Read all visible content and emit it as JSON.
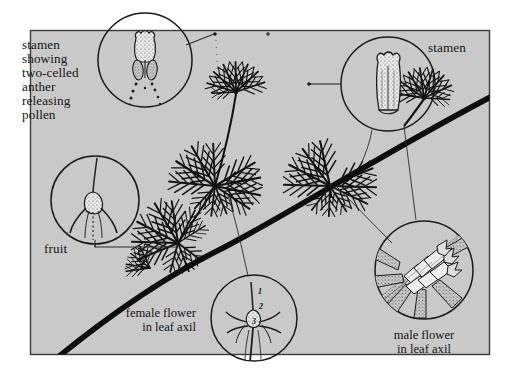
{
  "figure": {
    "panel": {
      "background_color": "#c9c9c9",
      "border_color": "#3b3b3b",
      "x": 30,
      "y": 30,
      "width": 460,
      "height": 325
    },
    "outer_background_color": "#ffffff",
    "ink_color": "#111111"
  },
  "labels": {
    "stamen_detail": {
      "lines": [
        "stamen",
        "showing",
        "two-celled",
        "anther",
        "releasing",
        "pollen"
      ],
      "align": "left",
      "x": 22,
      "y": 49
    },
    "stamen": {
      "text": "stamen",
      "align": "left",
      "x": 428,
      "y": 52
    },
    "fruit": {
      "text": "fruit",
      "align": "left",
      "x": 44,
      "y": 253
    },
    "female_flower": {
      "lines": [
        "female flower",
        "in leaf axil"
      ],
      "align": "right",
      "x": 196,
      "y": 317
    },
    "male_flower": {
      "lines": [
        "male flower",
        "in leaf axil"
      ],
      "align": "center",
      "x": 424,
      "y": 339
    }
  },
  "callouts": [
    {
      "name": "pollen-release-circle",
      "subject": "stamen showing two-celled anther releasing pollen",
      "cx": 145,
      "cy": 60,
      "r": 48
    },
    {
      "name": "fruit-circle",
      "subject": "fruit",
      "cx": 95,
      "cy": 200,
      "r": 45
    },
    {
      "name": "stamen-circle",
      "subject": "stamen",
      "cx": 388,
      "cy": 84,
      "r": 48
    },
    {
      "name": "female-flower-circle",
      "subject": "female flower in leaf axil",
      "cx": 254,
      "cy": 318,
      "r": 44
    },
    {
      "name": "male-flower-circle",
      "subject": "male flower in leaf axil",
      "cx": 424,
      "cy": 270,
      "r": 50
    }
  ],
  "female_flower_parts": [
    {
      "number": "1",
      "x": 258,
      "y": 294
    },
    {
      "number": "2",
      "x": 258,
      "y": 308
    },
    {
      "number": "3",
      "x": 254,
      "y": 322
    }
  ],
  "plant": {
    "stem_description": "thick dark main stem running diagonally from lower-left to upper-right",
    "whorl_nodes": [
      {
        "x": 178,
        "y": 243
      },
      {
        "x": 215,
        "y": 186
      },
      {
        "x": 330,
        "y": 186
      },
      {
        "x": 236,
        "y": 92
      },
      {
        "x": 424,
        "y": 98
      }
    ]
  }
}
